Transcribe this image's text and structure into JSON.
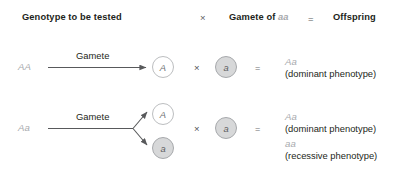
{
  "header": {
    "col1": "Genotype to be tested",
    "op1": "×",
    "col2_prefix": "Gamete of ",
    "col2_gene": "aa",
    "op2": "=",
    "col3": "Offspring"
  },
  "rows": [
    {
      "genotype": "AA",
      "arrow_label": "Gamete",
      "gametes": [
        {
          "allele": "A",
          "type": "dominant"
        }
      ],
      "cross_op": "×",
      "partner_gamete": {
        "allele": "a",
        "type": "recessive"
      },
      "equals_op": "=",
      "offspring": [
        {
          "genotype": "Aa",
          "phenotype": "(dominant phenotype)"
        }
      ]
    },
    {
      "genotype": "Aa",
      "arrow_label": "Gamete",
      "gametes": [
        {
          "allele": "A",
          "type": "dominant"
        },
        {
          "allele": "a",
          "type": "recessive"
        }
      ],
      "cross_op": "×",
      "partner_gamete": {
        "allele": "a",
        "type": "recessive"
      },
      "equals_op": "=",
      "offspring": [
        {
          "genotype": "Aa",
          "phenotype": "(dominant phenotype)"
        },
        {
          "genotype": "aa",
          "phenotype": "(recessive phenotype)"
        }
      ]
    }
  ],
  "colors": {
    "background": "#ffffff",
    "text_dark": "#231f20",
    "text_gray": "#a7a9ac",
    "circle_fill_dominant": "#ffffff",
    "circle_fill_recessive": "#d7d8d9",
    "circle_stroke": "#a7a9ac",
    "arrow": "#58595b"
  }
}
